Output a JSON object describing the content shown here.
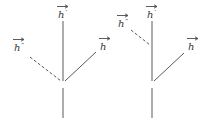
{
  "colors": {
    "line": "#5a5a5a",
    "text": "#333333",
    "background": "#ffffff"
  },
  "diagrams": [
    {
      "name": "left-tree",
      "labels": {
        "top": {
          "symbol": "h",
          "prime": "′"
        },
        "left": {
          "symbol": "h",
          "prime": "″"
        },
        "right": {
          "symbol": "h",
          "prime": ""
        }
      },
      "edges": {
        "left_branch_style": "dashed",
        "right_branch_style": "solid"
      }
    },
    {
      "name": "right-tree",
      "labels": {
        "top": {
          "symbol": "h",
          "prime": "′"
        },
        "left": {
          "symbol": "h",
          "prime": "″"
        },
        "right": {
          "symbol": "h",
          "prime": ""
        }
      },
      "edges": {
        "left_branch_style": "dashed",
        "right_branch_style": "solid"
      }
    }
  ]
}
